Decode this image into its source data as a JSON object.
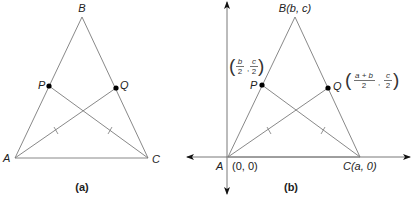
{
  "figure_a": {
    "caption": "(a)",
    "vertices": {
      "A": {
        "label": "A",
        "x": 15,
        "y": 158
      },
      "B": {
        "label": "B",
        "x": 82,
        "y": 17
      },
      "C": {
        "label": "C",
        "x": 148,
        "y": 158
      }
    },
    "midpoints": {
      "P": {
        "label": "P",
        "x": 49,
        "y": 86
      },
      "Q": {
        "label": "Q",
        "x": 116,
        "y": 88
      }
    }
  },
  "figure_b": {
    "caption": "(b)",
    "vertices": {
      "A": {
        "label": "A",
        "coord": "(0, 0)",
        "x": 228,
        "y": 157
      },
      "B": {
        "label": "B(b, c)",
        "x": 295,
        "y": 17
      },
      "C": {
        "label": "C(a, 0)",
        "x": 360,
        "y": 157
      }
    },
    "midpoints": {
      "P": {
        "label": "P",
        "coord_num_x": "b",
        "coord_den_x": "2",
        "coord_num_y": "c",
        "coord_den_y": "2"
      },
      "Q": {
        "label": "Q",
        "coord_num_x": "a + b",
        "coord_den_x": "2",
        "coord_num_y": "c",
        "coord_den_y": "2"
      }
    },
    "separator": ","
  },
  "colors": {
    "line": "#7a7a7a",
    "point": "#000000",
    "text": "#222222"
  }
}
